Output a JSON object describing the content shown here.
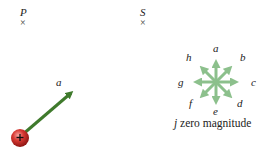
{
  "points": [
    {
      "id": "P",
      "label": "P",
      "marker": "×"
    },
    {
      "id": "S",
      "label": "S",
      "marker": "×"
    }
  ],
  "vector": {
    "label": "a",
    "symbol": "a⃗",
    "color": "#3f7a2c"
  },
  "charge": {
    "sign": "+",
    "color": "#c8282a"
  },
  "direction_options": {
    "labels": {
      "a": "a",
      "b": "b",
      "c": "c",
      "d": "d",
      "e": "e",
      "f": "f",
      "g": "g",
      "h": "h"
    },
    "color": "#8cc08c",
    "zero_option_letter": "j",
    "zero_option_text": " zero magnitude"
  }
}
